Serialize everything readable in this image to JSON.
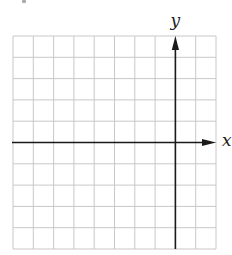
{
  "diagram": {
    "type": "coordinate-grid",
    "grid": {
      "columns": 10,
      "rows": 10,
      "left": 13,
      "top": 36,
      "right": 216,
      "bottom": 249,
      "line_color": "#c8c8c8"
    },
    "axes": {
      "color": "#1a1a1a",
      "x_axis": {
        "label": "x",
        "row_index_from_top": 5,
        "arrow": "right"
      },
      "y_axis": {
        "label": "y",
        "column_index_from_left": 8,
        "arrow": "up"
      }
    }
  }
}
